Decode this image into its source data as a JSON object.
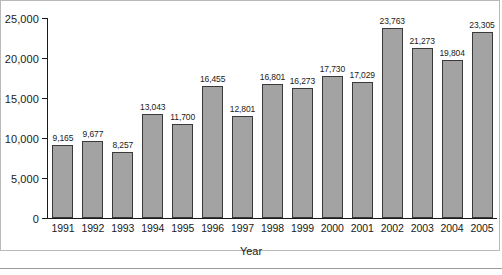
{
  "chart_data": {
    "type": "bar",
    "title": "",
    "xlabel": "Year",
    "ylabel": "",
    "categories": [
      "1991",
      "1992",
      "1993",
      "1994",
      "1995",
      "1996",
      "1997",
      "1998",
      "1999",
      "2000",
      "2001",
      "2002",
      "2003",
      "2004",
      "2005"
    ],
    "values": [
      9165,
      9677,
      8257,
      13043,
      11700,
      16455,
      12801,
      16801,
      16273,
      17730,
      17029,
      23763,
      21273,
      19804,
      23305
    ],
    "value_labels": [
      "9,165",
      "9,677",
      "8,257",
      "13,043",
      "11,700",
      "16,455",
      "12,801",
      "16,801",
      "16,273",
      "17,730",
      "17,029",
      "23,763",
      "21,273",
      "19,804",
      "23,305"
    ],
    "ylim": [
      0,
      25000
    ],
    "ytick_values": [
      0,
      5000,
      10000,
      15000,
      20000,
      25000
    ],
    "ytick_labels": [
      "0",
      "5,000",
      "10,000",
      "15,000",
      "20,000",
      "25,000"
    ],
    "grid": false,
    "legend": null,
    "bar_color": "#a3a3a3",
    "bar_border_color": "#3a3a3a",
    "axis_color": "#1a1a1a",
    "frame_color": "#b9b9b9",
    "rule_color": "#9a9a9a"
  },
  "axis": {
    "x_title": "Year"
  }
}
